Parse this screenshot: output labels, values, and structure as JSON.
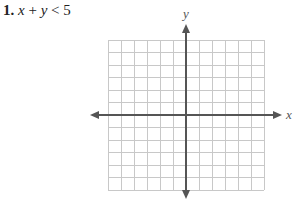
{
  "problem": {
    "number": "1.",
    "var1": "x",
    "op1": " + ",
    "var2": "y",
    "op2": " < ",
    "constant": "5"
  },
  "graph": {
    "x_axis_label": "x",
    "y_axis_label": "y",
    "grid_cells_x": 12,
    "grid_cells_y": 12,
    "grid_color": "#c8c8c8",
    "axis_color": "#555555"
  }
}
